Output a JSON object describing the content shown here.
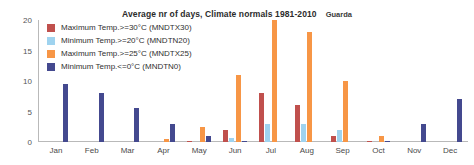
{
  "header": {
    "title": "Average nr of days, Climate normals 1981-2010",
    "station": "Guarda"
  },
  "legend": {
    "position": "top-left-inside",
    "items": [
      {
        "label": "Maximum Temp.>=30°C (MNDTX30)",
        "color": "#c0504d",
        "key": "MNDTX30"
      },
      {
        "label": "Minimum Temp.>=20°C (MNDTN20)",
        "color": "#9fd3ef",
        "key": "MNDTN20"
      },
      {
        "label": "Maximum Temp.>=25°C (MNDTX25)",
        "color": "#f79646",
        "key": "MNDTX25"
      },
      {
        "label": "Minimum Temp.<=0°C (MNDTN0)",
        "color": "#44498f",
        "key": "MNDTN0"
      }
    ]
  },
  "axes": {
    "y_ticks": [
      "0",
      "5",
      "10",
      "15",
      "20"
    ],
    "x_labels": [
      "Jan",
      "Feb",
      "Mar",
      "Apr",
      "May",
      "Jun",
      "Jul",
      "Aug",
      "Sep",
      "Oct",
      "Nov",
      "Dec"
    ]
  },
  "chart_data": {
    "type": "bar",
    "title": "Average nr of days, Climate normals 1981-2010",
    "subtitle": "Guarda",
    "xlabel": "",
    "ylabel": "",
    "ylim": [
      0,
      20
    ],
    "yticks": [
      0,
      5,
      10,
      15,
      20
    ],
    "grid": false,
    "legend_position": "upper left",
    "categories": [
      "Jan",
      "Feb",
      "Mar",
      "Apr",
      "May",
      "Jun",
      "Jul",
      "Aug",
      "Sep",
      "Oct",
      "Nov",
      "Dec"
    ],
    "series": [
      {
        "name": "Maximum Temp.>=30°C (MNDTX30)",
        "color": "#c0504d",
        "values": [
          0,
          0,
          0,
          0,
          0.1,
          2,
          8,
          6,
          1,
          0.1,
          0,
          0
        ]
      },
      {
        "name": "Minimum Temp.>=20°C (MNDTN20)",
        "color": "#9fd3ef",
        "values": [
          0,
          0,
          0,
          0,
          0,
          0.7,
          3,
          3,
          2,
          0,
          0,
          0
        ]
      },
      {
        "name": "Maximum Temp.>=25°C (MNDTX25)",
        "color": "#f79646",
        "values": [
          0,
          0,
          0,
          0.5,
          2.5,
          11,
          20,
          18,
          10,
          1,
          0,
          0
        ]
      },
      {
        "name": "Minimum Temp.<=0°C (MNDTN0)",
        "color": "#44498f",
        "values": [
          9.5,
          8,
          5.5,
          3,
          1,
          0.2,
          0,
          0,
          0,
          0.2,
          3,
          7
        ]
      }
    ]
  }
}
